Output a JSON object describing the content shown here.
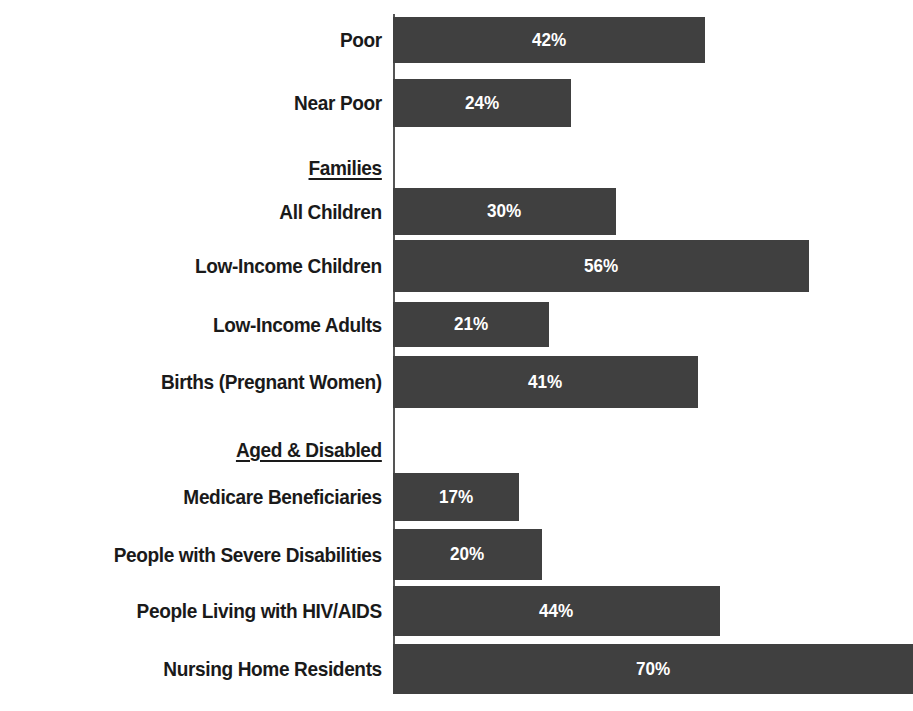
{
  "chart_data": {
    "type": "bar",
    "orientation": "horizontal",
    "title": "",
    "subtitle": "",
    "xlabel": "",
    "ylabel": "",
    "xlim": [
      0,
      70
    ],
    "grid": false,
    "legend": null,
    "value_suffix": "%",
    "bar_color": "#404040",
    "value_label_color": "#ffffff",
    "axis_color": "#555555",
    "categories": [
      "Poor",
      "Near Poor",
      "All Children",
      "Low-Income Children",
      "Low-Income Adults",
      "Births (Pregnant Women)",
      "Medicare Beneficiaries",
      "People with Severe Disabilities",
      "People Living with HIV/AIDS",
      "Nursing Home Residents"
    ],
    "values": [
      42,
      24,
      30,
      56,
      21,
      41,
      17,
      20,
      44,
      70
    ],
    "value_labels": [
      "42%",
      "24%",
      "30%",
      "56%",
      "21%",
      "41%",
      "17%",
      "20%",
      "44%",
      "70%"
    ],
    "group_headers": [
      "Families",
      "Aged & Disabled"
    ],
    "rows": [
      {
        "kind": "bar",
        "label": "Poor",
        "value": 42,
        "value_label": "42%",
        "top": 17,
        "height": 46
      },
      {
        "kind": "bar",
        "label": "Near Poor",
        "value": 24,
        "value_label": "24%",
        "top": 79,
        "height": 48
      },
      {
        "kind": "group",
        "label": "Families",
        "value": null,
        "value_label": "",
        "top": 150,
        "height": 36
      },
      {
        "kind": "bar",
        "label": "All Children",
        "value": 30,
        "value_label": "30%",
        "top": 188,
        "height": 47
      },
      {
        "kind": "bar",
        "label": "Low-Income Children",
        "value": 56,
        "value_label": "56%",
        "top": 240,
        "height": 52
      },
      {
        "kind": "bar",
        "label": "Low-Income Adults",
        "value": 21,
        "value_label": "21%",
        "top": 302,
        "height": 45
      },
      {
        "kind": "bar",
        "label": "Births (Pregnant Women)",
        "value": 41,
        "value_label": "41%",
        "top": 356,
        "height": 52
      },
      {
        "kind": "group",
        "label": "Aged & Disabled",
        "value": null,
        "value_label": "",
        "top": 432,
        "height": 36
      },
      {
        "kind": "bar",
        "label": "Medicare Beneficiaries",
        "value": 17,
        "value_label": "17%",
        "top": 473,
        "height": 48
      },
      {
        "kind": "bar",
        "label": "People with Severe Disabilities",
        "value": 20,
        "value_label": "20%",
        "top": 529,
        "height": 51
      },
      {
        "kind": "bar",
        "label": "People Living with HIV/AIDS",
        "value": 44,
        "value_label": "44%",
        "top": 586,
        "height": 50
      },
      {
        "kind": "bar",
        "label": "Nursing Home Residents",
        "value": 70,
        "value_label": "70%",
        "top": 644,
        "height": 50
      }
    ]
  }
}
